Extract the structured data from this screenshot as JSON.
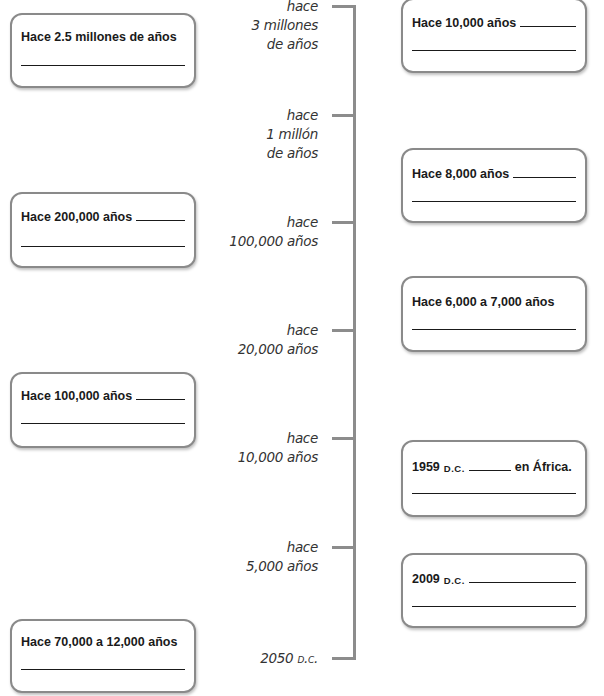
{
  "timeline": {
    "ticks": [
      {
        "lines": [
          "hace",
          "3 millones",
          "de años"
        ]
      },
      {
        "lines": [
          "hace",
          "1 millón",
          "de años"
        ]
      },
      {
        "lines": [
          "hace",
          "100,000 años"
        ]
      },
      {
        "lines": [
          "hace",
          "20,000 años"
        ]
      },
      {
        "lines": [
          "hace",
          "10,000 años"
        ]
      },
      {
        "lines": [
          "hace",
          "5,000 años"
        ]
      },
      {
        "lines": [
          "2050 d.c."
        ]
      }
    ]
  },
  "left_boxes": [
    {
      "title": "Hace 2.5 millones de años"
    },
    {
      "title": "Hace 200,000 años"
    },
    {
      "title": "Hace 100,000 años"
    },
    {
      "title": "Hace 70,000 a 12,000 años"
    }
  ],
  "right_boxes": [
    {
      "title": "Hace 10,000 años"
    },
    {
      "title": "Hace 8,000 años"
    },
    {
      "title": "Hace 6,000 a 7,000 años"
    },
    {
      "title": "1959",
      "era": "D.C.",
      "suffix": "en África."
    },
    {
      "title": "2009",
      "era": "D.C."
    }
  ],
  "colors": {
    "axis": "#8c8c8c",
    "box_border": "#8a8a8a",
    "text": "#1a1a1a",
    "label_text": "#333333"
  }
}
